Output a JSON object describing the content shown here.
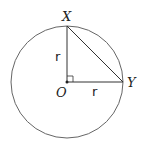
{
  "diagram": {
    "type": "geometry",
    "points": {
      "X": {
        "label": "X"
      },
      "Y": {
        "label": "Y"
      },
      "O": {
        "label": "O"
      }
    },
    "segments": [
      {
        "from": "O",
        "to": "X",
        "label": "r"
      },
      {
        "from": "O",
        "to": "Y",
        "label": "r"
      },
      {
        "from": "X",
        "to": "Y",
        "label": ""
      }
    ],
    "right_angle_at": "O",
    "colors": {
      "stroke": "#333333",
      "circle": "#666666",
      "text": "#222222"
    }
  }
}
